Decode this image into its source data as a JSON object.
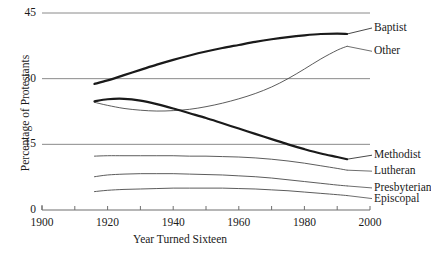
{
  "chart_data": {
    "type": "line",
    "title": "",
    "xlabel": "Year Turned Sixteen",
    "ylabel": "Percentage of Protestants",
    "xlim": [
      1900,
      2000
    ],
    "ylim": [
      0,
      45
    ],
    "xticks": [
      1900,
      1910,
      1920,
      1930,
      1940,
      1950,
      1960,
      1970,
      1980,
      1990,
      2000
    ],
    "xticklabels": [
      "1900",
      "",
      "1920",
      "",
      "1940",
      "",
      "1960",
      "",
      "1980",
      "",
      "2000"
    ],
    "yticks": [
      0,
      15,
      30,
      45
    ],
    "yticklabels": [
      "0",
      "15",
      "30",
      "45"
    ],
    "grid": "horizontal",
    "legend_position": "right-inline-end-of-line",
    "series": [
      {
        "name": "Baptist",
        "label": "Baptist",
        "emphasis": "thick",
        "color": "#1a1a1a",
        "x": [
          1916,
          1920,
          1925,
          1930,
          1935,
          1940,
          1945,
          1950,
          1955,
          1960,
          1965,
          1970,
          1975,
          1980,
          1985,
          1990,
          1993
        ],
        "y": [
          28.8,
          29.6,
          30.8,
          32.0,
          33.2,
          34.3,
          35.3,
          36.2,
          37.0,
          37.7,
          38.4,
          39.0,
          39.5,
          39.9,
          40.2,
          40.3,
          40.2
        ]
      },
      {
        "name": "Other",
        "label": "Other",
        "emphasis": "thin",
        "color": "#4a4a4a",
        "x": [
          1916,
          1920,
          1925,
          1930,
          1935,
          1940,
          1945,
          1950,
          1955,
          1960,
          1965,
          1970,
          1975,
          1980,
          1985,
          1990,
          1993
        ],
        "y": [
          24.6,
          23.9,
          23.2,
          22.8,
          22.6,
          22.7,
          23.0,
          23.6,
          24.4,
          25.4,
          26.6,
          28.1,
          30.0,
          32.2,
          34.5,
          36.5,
          37.4
        ]
      },
      {
        "name": "Methodist",
        "label": "Methodist",
        "emphasis": "thick",
        "color": "#1a1a1a",
        "x": [
          1916,
          1920,
          1925,
          1930,
          1935,
          1940,
          1945,
          1950,
          1955,
          1960,
          1965,
          1970,
          1975,
          1980,
          1985,
          1990,
          1993
        ],
        "y": [
          24.8,
          25.3,
          25.4,
          25.0,
          24.2,
          23.2,
          22.1,
          21.0,
          19.8,
          18.6,
          17.4,
          16.2,
          15.0,
          13.9,
          12.9,
          12.1,
          11.6
        ]
      },
      {
        "name": "Lutheran",
        "label": "Lutheran",
        "emphasis": "thin",
        "color": "#4a4a4a",
        "x": [
          1916,
          1920,
          1925,
          1930,
          1935,
          1940,
          1945,
          1950,
          1955,
          1960,
          1965,
          1970,
          1975,
          1980,
          1985,
          1990,
          1993
        ],
        "y": [
          12.3,
          12.4,
          12.4,
          12.4,
          12.4,
          12.4,
          12.3,
          12.3,
          12.2,
          12.1,
          11.9,
          11.6,
          11.2,
          10.7,
          10.1,
          9.5,
          9.1
        ]
      },
      {
        "name": "Presbyterian",
        "label": "Presbyterian",
        "emphasis": "thin",
        "color": "#4a4a4a",
        "x": [
          1916,
          1920,
          1925,
          1930,
          1935,
          1940,
          1945,
          1950,
          1955,
          1960,
          1965,
          1970,
          1975,
          1980,
          1985,
          1990,
          1993
        ],
        "y": [
          7.6,
          8.0,
          8.2,
          8.3,
          8.3,
          8.3,
          8.2,
          8.1,
          8.0,
          7.8,
          7.6,
          7.3,
          6.9,
          6.5,
          6.1,
          5.7,
          5.5
        ]
      },
      {
        "name": "Episcopal",
        "label": "Episcopal",
        "emphasis": "thin",
        "color": "#4a4a4a",
        "x": [
          1916,
          1920,
          1925,
          1930,
          1935,
          1940,
          1945,
          1950,
          1955,
          1960,
          1965,
          1970,
          1975,
          1980,
          1985,
          1990,
          1993
        ],
        "y": [
          4.2,
          4.5,
          4.7,
          4.8,
          4.9,
          5.0,
          5.0,
          5.0,
          5.0,
          4.9,
          4.8,
          4.6,
          4.4,
          4.1,
          3.8,
          3.5,
          3.3
        ]
      }
    ]
  }
}
